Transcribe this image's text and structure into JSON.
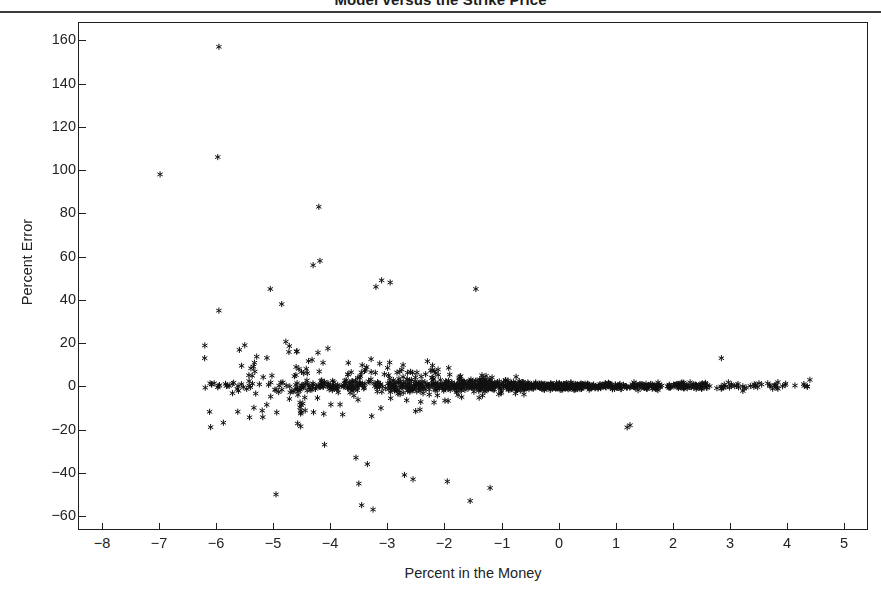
{
  "chart_data": {
    "type": "scatter",
    "title": "Model versus the Strike Price",
    "xlabel": "Percent in the Money",
    "ylabel": "Percent Error",
    "xlim": [
      -8.4,
      5.4
    ],
    "ylim": [
      -66,
      168
    ],
    "xticks": [
      -8,
      -7,
      -6,
      -5,
      -4,
      -3,
      -2,
      -1,
      0,
      1,
      2,
      3,
      4,
      5
    ],
    "xtick_labels": [
      "−8",
      "−7",
      "−6",
      "−5",
      "−4",
      "−3",
      "−2",
      "−1",
      "0",
      "1",
      "2",
      "3",
      "4",
      "5"
    ],
    "yticks": [
      -60,
      -40,
      -20,
      0,
      20,
      40,
      60,
      80,
      100,
      120,
      140,
      160
    ],
    "ytick_labels": [
      "−60",
      "−40",
      "−20",
      "0",
      "20",
      "40",
      "60",
      "80",
      "100",
      "120",
      "140",
      "160"
    ],
    "grid": false,
    "legend": null,
    "marker": "asterisk",
    "marker_color": "#111111",
    "n_points": 1150,
    "series": [
      {
        "name": "Percent Error",
        "description": "Dense band of option pricing errors near zero percent error, fanning out for deep out-of-the-money options (negative percent in the money).",
        "notable_outliers": [
          {
            "x": -5.95,
            "y": 157
          },
          {
            "x": -5.97,
            "y": 106
          },
          {
            "x": -6.98,
            "y": 98
          },
          {
            "x": -4.2,
            "y": 83
          },
          {
            "x": -4.18,
            "y": 58
          },
          {
            "x": -4.3,
            "y": 56
          },
          {
            "x": -3.1,
            "y": 49
          },
          {
            "x": -2.95,
            "y": 48
          },
          {
            "x": -3.2,
            "y": 46
          },
          {
            "x": -1.45,
            "y": 45
          },
          {
            "x": -5.05,
            "y": 45
          },
          {
            "x": -4.85,
            "y": 38
          },
          {
            "x": -5.95,
            "y": 35
          },
          {
            "x": -6.2,
            "y": 13
          },
          {
            "x": -4.1,
            "y": -27
          },
          {
            "x": -3.55,
            "y": -33
          },
          {
            "x": -3.35,
            "y": -36
          },
          {
            "x": -3.5,
            "y": -45
          },
          {
            "x": -2.7,
            "y": -41
          },
          {
            "x": -2.55,
            "y": -43
          },
          {
            "x": -1.95,
            "y": -44
          },
          {
            "x": -1.55,
            "y": -53
          },
          {
            "x": -3.45,
            "y": -55
          },
          {
            "x": -3.25,
            "y": -57
          },
          {
            "x": -4.95,
            "y": -50
          },
          {
            "x": -1.2,
            "y": -47
          },
          {
            "x": 1.2,
            "y": -19
          },
          {
            "x": 1.25,
            "y": -18
          },
          {
            "x": 2.85,
            "y": 13
          },
          {
            "x": 4.4,
            "y": 3
          }
        ],
        "x_range_observed": [
          -6.2,
          4.4
        ],
        "y_range_observed": [
          -57,
          157
        ]
      }
    ]
  },
  "page": {
    "background_color": "#ffffff",
    "axis_color": "#1f1f1f",
    "text_color": "#232323"
  }
}
